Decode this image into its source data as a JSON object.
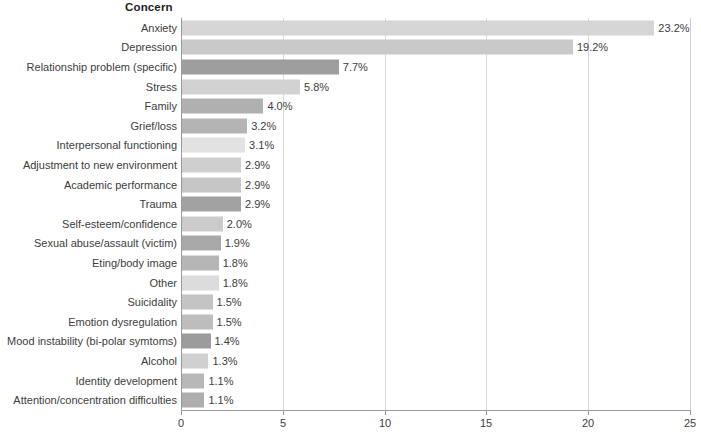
{
  "chart_data": {
    "type": "bar",
    "orientation": "horizontal",
    "title": "Concern",
    "xlabel": "",
    "ylabel": "",
    "xlim": [
      0,
      25
    ],
    "xticks": [
      0,
      5,
      10,
      15,
      20,
      25
    ],
    "xtick_labels": [
      "0",
      "5",
      "10",
      "15",
      "20",
      "25"
    ],
    "grid": "vertical",
    "legend": "none",
    "value_suffix": "%",
    "categories": [
      "Anxiety",
      "Depression",
      "Relationship problem (specific)",
      "Stress",
      "Family",
      "Grief/loss",
      "Interpersonal functioning",
      "Adjustment to new environment",
      "Academic performance",
      "Trauma",
      "Self-esteem/confidence",
      "Sexual abuse/assault (victim)",
      "Eting/body image",
      "Other",
      "Suicidality",
      "Emotion dysregulation",
      "Mood instability (bi-polar symtoms)",
      "Alcohol",
      "Identity development",
      "Attention/concentration difficulties"
    ],
    "values": [
      23.2,
      19.2,
      7.7,
      5.8,
      4.0,
      3.2,
      3.1,
      2.9,
      2.9,
      2.9,
      2.0,
      1.9,
      1.8,
      1.8,
      1.5,
      1.5,
      1.4,
      1.3,
      1.1,
      1.1
    ],
    "value_labels": [
      "23.2%",
      "19.2%",
      "7.7%",
      "5.8%",
      "4.0%",
      "3.2%",
      "3.1%",
      "2.9%",
      "2.9%",
      "2.9%",
      "2.0%",
      "1.9%",
      "1.8%",
      "1.8%",
      "1.5%",
      "1.5%",
      "1.4%",
      "1.3%",
      "1.1%",
      "1.1%"
    ],
    "bar_colors": [
      "#d5d5d5",
      "#c9c9c9",
      "#9e9e9e",
      "#d2d2d2",
      "#b0b0b0",
      "#b4b4b4",
      "#e2e2e2",
      "#cfcfcf",
      "#c6c6c6",
      "#a2a2a2",
      "#cbcbcb",
      "#a8a8a8",
      "#b6b6b6",
      "#dcdcdc",
      "#c4c4c4",
      "#bdbdbd",
      "#9c9c9c",
      "#d0d0d0",
      "#b8b8b8",
      "#adadad"
    ],
    "axis_color": "#9b9b9b",
    "grid_color": "#d8d8d8",
    "text_color": "#3d3d3d"
  }
}
